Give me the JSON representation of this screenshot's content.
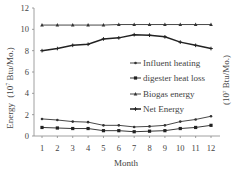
{
  "chart_data": {
    "type": "line",
    "title": "",
    "xlabel": "Month",
    "ylabel": "Energy (10^7 Btu/Mo.)",
    "ylabel_main": "Energy",
    "ylabel_unit": "(10",
    "ylabel_exp": "7",
    "ylabel_rest": " Btu/Mo.)",
    "ylim": [
      0,
      12
    ],
    "yticks": [
      "0",
      "2",
      "4",
      "6",
      "8",
      "10",
      "12"
    ],
    "categories": [
      "1",
      "2",
      "3",
      "4",
      "5",
      "6",
      "7",
      "8",
      "9",
      "10",
      "11",
      "12"
    ],
    "grid": false,
    "legend_position": "center-right",
    "series": [
      {
        "name": "Influent heating",
        "marker": "plus",
        "values": [
          1.6,
          1.5,
          1.35,
          1.3,
          1.0,
          1.0,
          0.85,
          0.9,
          1.0,
          1.35,
          1.55,
          1.85
        ]
      },
      {
        "name": "digester heat loss",
        "marker": "square",
        "values": [
          0.8,
          0.75,
          0.7,
          0.7,
          0.5,
          0.5,
          0.4,
          0.45,
          0.5,
          0.7,
          0.8,
          1.0
        ]
      },
      {
        "name": "Biogas energy",
        "marker": "triangle",
        "values": [
          10.4,
          10.4,
          10.4,
          10.4,
          10.4,
          10.45,
          10.45,
          10.45,
          10.45,
          10.45,
          10.45,
          10.45
        ]
      },
      {
        "name": "Net Energy",
        "marker": "star",
        "values": [
          8.0,
          8.2,
          8.5,
          8.6,
          9.1,
          9.2,
          9.5,
          9.45,
          9.3,
          8.8,
          8.5,
          8.2
        ]
      }
    ]
  },
  "legend": {
    "items": [
      "Influent heating",
      "digester heat loss",
      "Biogas energy",
      "Net Energy"
    ]
  },
  "cropped_right_text": "(10^7 Btu/Mo.)"
}
